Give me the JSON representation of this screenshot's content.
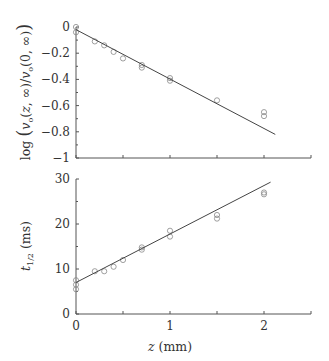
{
  "chart_data": [
    {
      "type": "scatter",
      "title": "",
      "xlabel": "z (mm)",
      "ylabel": "log ( v_o(z, ∞) / v_o(0, ∞) )",
      "xlim": [
        0,
        2.5
      ],
      "ylim": [
        -1,
        0
      ],
      "xticks": [
        0,
        0.5,
        1,
        1.5,
        2,
        2.5
      ],
      "yticks": [
        0,
        -0.2,
        -0.4,
        -0.6,
        -0.8,
        -1
      ],
      "ytick_labels": [
        "0",
        "−0.2",
        "−0.4",
        "−0.6",
        "−0.8",
        "−1"
      ],
      "grid": false,
      "series": [
        {
          "name": "data",
          "marker": "open-circle",
          "x": [
            0,
            0,
            0.2,
            0.3,
            0.4,
            0.5,
            0.7,
            0.7,
            1.0,
            1.0,
            1.5,
            2.0,
            2.0
          ],
          "y": [
            0,
            -0.04,
            -0.11,
            -0.14,
            -0.19,
            -0.24,
            -0.29,
            -0.31,
            -0.39,
            -0.41,
            -0.56,
            -0.65,
            -0.68
          ]
        },
        {
          "name": "fit",
          "style": "line",
          "x": [
            0,
            2.12
          ],
          "y": [
            -0.02,
            -0.82
          ]
        }
      ]
    },
    {
      "type": "scatter",
      "title": "",
      "xlabel": "z (mm)",
      "ylabel": "t_1/2 (ms)",
      "xlim": [
        0,
        2.5
      ],
      "ylim": [
        0,
        30
      ],
      "xticks": [
        0,
        0.5,
        1,
        1.5,
        2,
        2.5
      ],
      "xtick_labels": [
        "0",
        "",
        "1",
        "",
        "2",
        ""
      ],
      "yticks": [
        0,
        10,
        20,
        30
      ],
      "ytick_labels": [
        "0",
        "10",
        "20",
        "30"
      ],
      "grid": false,
      "series": [
        {
          "name": "data",
          "marker": "open-circle",
          "x": [
            0,
            0,
            0,
            0.2,
            0.3,
            0.4,
            0.5,
            0.7,
            0.7,
            1.0,
            1.0,
            1.5,
            1.5,
            2.0,
            2.0
          ],
          "y": [
            7.5,
            6.5,
            5.5,
            9.5,
            9.5,
            10.5,
            12,
            14.8,
            14.3,
            18.5,
            17.2,
            22,
            21.2,
            27,
            26.6
          ]
        },
        {
          "name": "fit",
          "style": "line",
          "x": [
            0,
            2.07
          ],
          "y": [
            7,
            29.3
          ]
        }
      ]
    }
  ],
  "labels": {
    "top_ylabel": "log",
    "bottom_ylabel": "t",
    "bottom_ylabel_sub": "1/2",
    "bottom_ylabel_unit": "(ms)",
    "xlabel_var": "z",
    "xlabel_unit": "(mm)"
  }
}
